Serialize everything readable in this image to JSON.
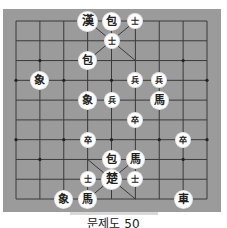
{
  "puzzle": {
    "caption": "문제도 50",
    "game": "Janggi"
  },
  "board": {
    "columns": 9,
    "rows": 10,
    "colors": {
      "board": "#9b9b9b",
      "line": "#3a3a3a",
      "piece": "#ffffff",
      "glyph": "#222222"
    }
  },
  "pieces": [
    {
      "glyph": "漢",
      "side": "han",
      "type": "general",
      "col": 3,
      "row": 0,
      "size": "big"
    },
    {
      "glyph": "包",
      "side": "han",
      "type": "cannon",
      "col": 4,
      "row": 0,
      "size": "normal"
    },
    {
      "glyph": "士",
      "side": "han",
      "type": "guard",
      "col": 5,
      "row": 0,
      "size": "small"
    },
    {
      "glyph": "士",
      "side": "han",
      "type": "guard",
      "col": 4,
      "row": 1,
      "size": "small"
    },
    {
      "glyph": "包",
      "side": "han",
      "type": "cannon",
      "col": 3,
      "row": 2,
      "size": "normal"
    },
    {
      "glyph": "象",
      "side": "han",
      "type": "elephant",
      "col": 1,
      "row": 3,
      "size": "normal"
    },
    {
      "glyph": "兵",
      "side": "han",
      "type": "soldier",
      "col": 5,
      "row": 3,
      "size": "small"
    },
    {
      "glyph": "兵",
      "side": "han",
      "type": "soldier",
      "col": 6,
      "row": 3,
      "size": "small"
    },
    {
      "glyph": "象",
      "side": "han",
      "type": "elephant",
      "col": 3,
      "row": 4,
      "size": "normal"
    },
    {
      "glyph": "兵",
      "side": "han",
      "type": "soldier",
      "col": 4,
      "row": 4,
      "size": "small"
    },
    {
      "glyph": "馬",
      "side": "han",
      "type": "horse",
      "col": 6,
      "row": 4,
      "size": "normal"
    },
    {
      "glyph": "卒",
      "side": "cho",
      "type": "soldier",
      "col": 5,
      "row": 5,
      "size": "small"
    },
    {
      "glyph": "卒",
      "side": "cho",
      "type": "soldier",
      "col": 3,
      "row": 6,
      "size": "small"
    },
    {
      "glyph": "卒",
      "side": "cho",
      "type": "soldier",
      "col": 7,
      "row": 6,
      "size": "small"
    },
    {
      "glyph": "包",
      "side": "cho",
      "type": "cannon",
      "col": 4,
      "row": 7,
      "size": "normal"
    },
    {
      "glyph": "馬",
      "side": "cho",
      "type": "horse",
      "col": 5,
      "row": 7,
      "size": "normal"
    },
    {
      "glyph": "士",
      "side": "cho",
      "type": "guard",
      "col": 3,
      "row": 8,
      "size": "small"
    },
    {
      "glyph": "楚",
      "side": "cho",
      "type": "general",
      "col": 4,
      "row": 8,
      "size": "big"
    },
    {
      "glyph": "士",
      "side": "cho",
      "type": "guard",
      "col": 5,
      "row": 8,
      "size": "small"
    },
    {
      "glyph": "象",
      "side": "cho",
      "type": "elephant",
      "col": 2,
      "row": 9,
      "size": "normal"
    },
    {
      "glyph": "馬",
      "side": "cho",
      "type": "horse",
      "col": 3,
      "row": 9,
      "size": "normal"
    },
    {
      "glyph": "車",
      "side": "cho",
      "type": "chariot",
      "col": 7,
      "row": 9,
      "size": "normal"
    }
  ]
}
